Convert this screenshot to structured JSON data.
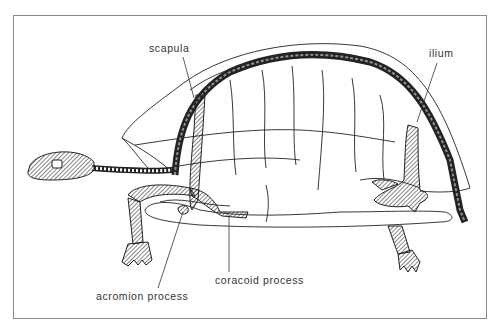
{
  "figure": {
    "labels": {
      "scapula": "scapula",
      "ilium": "ilium",
      "coracoid_process": "coracoid process",
      "acromion_process": "acromion process"
    },
    "colors": {
      "line": "#222222",
      "frame": "#8a8a8a",
      "background": "#ffffff"
    }
  }
}
